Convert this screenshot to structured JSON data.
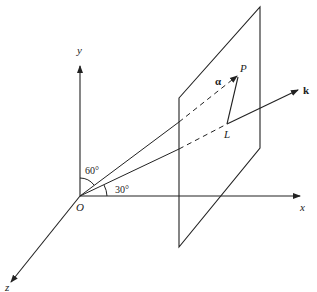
{
  "diagram": {
    "axes": {
      "x_label": "x",
      "y_label": "y",
      "z_label": "z",
      "origin_label": "O"
    },
    "points": {
      "P": "P",
      "L": "L"
    },
    "vectors": {
      "alpha": "α",
      "k": "k"
    },
    "angles": {
      "to_y": "60°",
      "to_x": "30°"
    },
    "colors": {
      "stroke": "#222222",
      "background": "#ffffff"
    }
  }
}
